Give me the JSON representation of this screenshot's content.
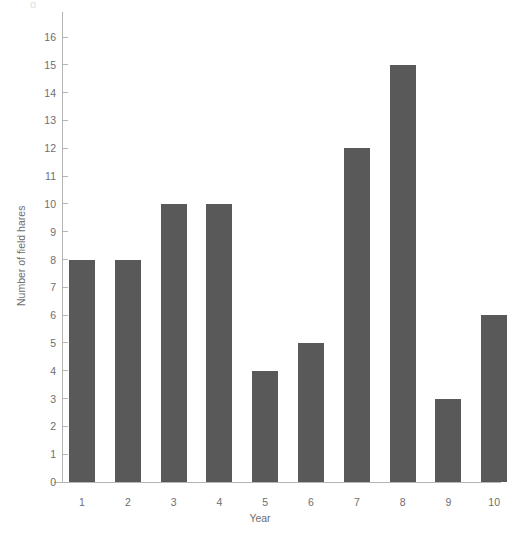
{
  "chart_data": {
    "type": "bar",
    "title": "",
    "xlabel": "Year",
    "ylabel": "Number of field hares",
    "categories": [
      "1",
      "2",
      "3",
      "4",
      "5",
      "6",
      "7",
      "8",
      "9",
      "10"
    ],
    "values": [
      8,
      8,
      10,
      10,
      4,
      5,
      12,
      15,
      3,
      6
    ],
    "ylim": [
      0,
      16
    ],
    "xlim": [
      0,
      11
    ],
    "y_ticks": [
      0,
      1,
      2,
      3,
      4,
      5,
      6,
      7,
      8,
      9,
      10,
      11,
      12,
      13,
      14,
      15,
      16
    ],
    "y_tick_labels": [
      "0",
      "1",
      "2",
      "3",
      "4",
      "5",
      "6",
      "7",
      "8",
      "9",
      "10",
      "11",
      "12",
      "13",
      "14",
      "15",
      "16"
    ],
    "grid": false,
    "legend": null,
    "legend_position": "none",
    "bar_color": "#595959",
    "axis_color": "#b5b5b5",
    "text_color": "#6e6e6e",
    "background_color": "#ffffff",
    "series": [
      {
        "name": "Number of field hares",
        "values": [
          8,
          8,
          10,
          10,
          4,
          5,
          12,
          15,
          3,
          6
        ]
      }
    ],
    "points": [
      {
        "year": "1",
        "count": 8
      },
      {
        "year": "2",
        "count": 8
      },
      {
        "year": "3",
        "count": 10
      },
      {
        "year": "4",
        "count": 10
      },
      {
        "year": "5",
        "count": 4
      },
      {
        "year": "6",
        "count": 5
      },
      {
        "year": "7",
        "count": 12
      },
      {
        "year": "8",
        "count": 15
      },
      {
        "year": "9",
        "count": 3
      },
      {
        "year": "10",
        "count": 6
      }
    ]
  },
  "artifact": {
    "glyph": "g"
  }
}
